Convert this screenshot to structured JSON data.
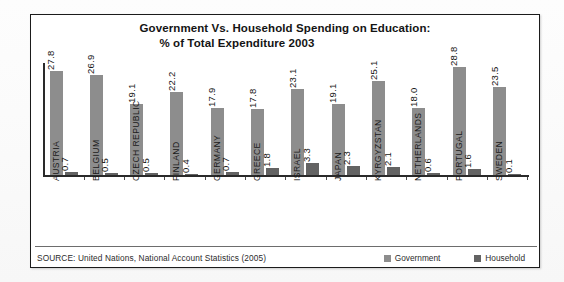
{
  "figure": {
    "title_line1": "Government Vs. Household Spending on Education:",
    "title_line2": "% of Total Expenditure 2003",
    "source": "SOURCE: United Nations, National Account Statistics (2005)"
  },
  "legend": {
    "items": [
      {
        "label": "Government",
        "color": "#8d8d8d"
      },
      {
        "label": "Household",
        "color": "#636363"
      }
    ]
  },
  "colors": {
    "government": "#8d8d8d",
    "household": "#636363",
    "frame": "#1b1b1b",
    "axis": "#2a2a2a",
    "text": "#161616"
  },
  "chart_data": {
    "type": "bar",
    "title": "Government Vs. Household Spending on Education: % of Total Expenditure 2003",
    "xlabel": "",
    "ylabel": "",
    "ylim": [
      0,
      30
    ],
    "grid": false,
    "legend_position": "bottom-right",
    "categories": [
      "AUSTRIA",
      "BELGIUM",
      "CZECH REPUBLIC",
      "FINLAND",
      "GERMANY",
      "GREECE",
      "ISRAEL",
      "JAPAN",
      "KYRGYZSTAN",
      "NETHERLANDS",
      "PORTUGAL",
      "SWEDEN"
    ],
    "series": [
      {
        "name": "Government",
        "values": [
          27.8,
          26.9,
          19.1,
          22.2,
          17.9,
          17.8,
          23.1,
          19.1,
          25.1,
          18.0,
          28.8,
          23.5
        ],
        "labels": [
          "27.8",
          "26.9",
          "19.1",
          "22.2",
          "17.9",
          "17.8",
          "23.1",
          "19.1",
          "25.1",
          "18.0",
          "28.8",
          "23.5"
        ]
      },
      {
        "name": "Household",
        "values": [
          0.7,
          0.5,
          0.5,
          0.4,
          0.7,
          1.8,
          3.3,
          2.3,
          2.1,
          0.6,
          1.6,
          0.1
        ],
        "labels": [
          "0.7",
          "0.5",
          "0.5",
          "0.4",
          "0.7",
          "1.8",
          "3.3",
          "2.3",
          "2.1",
          "0.6",
          "1.6",
          "0.1"
        ]
      }
    ]
  }
}
